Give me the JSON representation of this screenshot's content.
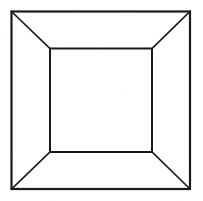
{
  "figure": {
    "kind": "line-drawing",
    "canvas": {
      "width": 203,
      "height": 201,
      "background_color": "#ffffff"
    },
    "style": {
      "stroke_color": "#1a1a1a",
      "outer_square_stroke_width": 2.2,
      "inner_square_stroke_width": 2.0,
      "diagonal_stroke_width": 1.6,
      "fill": "none",
      "line_cap": "square"
    },
    "shapes": {
      "outer_square": {
        "name": "outer-square",
        "label": "Outer square (front opening of box)",
        "x": 11.5,
        "y": 11.5,
        "width": 178.5,
        "height": 177.5,
        "corners": {
          "top_left": [
            11.5,
            11.5
          ],
          "top_right": [
            190.0,
            11.5
          ],
          "bottom_right": [
            190.0,
            189.0
          ],
          "bottom_left": [
            11.5,
            189.0
          ]
        }
      },
      "inner_square": {
        "name": "inner-square",
        "label": "Inner square (back wall of box)",
        "x": 50.0,
        "y": 48.5,
        "width": 102.0,
        "height": 103.5,
        "corners": {
          "top_left": [
            50.0,
            48.5
          ],
          "top_right": [
            152.0,
            48.5
          ],
          "bottom_right": [
            152.0,
            152.0
          ],
          "bottom_left": [
            50.0,
            152.0
          ]
        }
      },
      "diagonals": [
        {
          "name": "diagonal-top-left",
          "label": "Top-left receding edge",
          "from": [
            11.5,
            11.5
          ],
          "to": [
            50.0,
            48.5
          ]
        },
        {
          "name": "diagonal-top-right",
          "label": "Top-right receding edge",
          "from": [
            190.0,
            11.5
          ],
          "to": [
            152.0,
            48.5
          ]
        },
        {
          "name": "diagonal-bottom-right",
          "label": "Bottom-right receding edge",
          "from": [
            190.0,
            189.0
          ],
          "to": [
            152.0,
            152.0
          ]
        },
        {
          "name": "diagonal-bottom-left",
          "label": "Bottom-left receding edge",
          "from": [
            11.5,
            189.0
          ],
          "to": [
            50.0,
            152.0
          ]
        }
      ]
    },
    "regions": [
      {
        "name": "face-top",
        "label": "Top inner face",
        "polygon": "11.5,11.5 190,11.5 152,48.5 50,48.5"
      },
      {
        "name": "face-right",
        "label": "Right inner face",
        "polygon": "190,11.5 190,189 152,152 152,48.5"
      },
      {
        "name": "face-bottom",
        "label": "Bottom inner face",
        "polygon": "11.5,189 190,189 152,152 50,152"
      },
      {
        "name": "face-left",
        "label": "Left inner face",
        "polygon": "11.5,11.5 50,48.5 50,152 11.5,189"
      }
    ],
    "text_content": []
  }
}
